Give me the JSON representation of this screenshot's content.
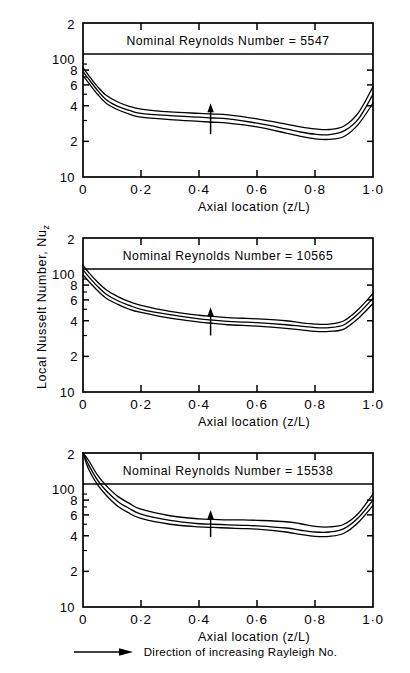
{
  "figure": {
    "axis_y_label_main": "Local Nusselt Number, Nu",
    "axis_y_label_sub": "z",
    "axis_x_label": "Axial location (z/L)",
    "legend_text": "Direction of increasing Rayleigh No.",
    "legend_icon": "right-arrow-icon",
    "annotation_icon": "up-arrow-icon",
    "line_color": "#000000",
    "background_color": "#ffffff"
  },
  "chart_data": [
    {
      "type": "line",
      "title": "Nominal Reynolds Number = 5547",
      "xlabel": "Axial location (z/L)",
      "ylabel": "Local Nusselt Number, Nuz",
      "yscale": "log",
      "ylim": [
        10,
        200
      ],
      "xlim": [
        0,
        1
      ],
      "grid": false,
      "xticks": [
        0,
        0.2,
        0.4,
        0.6,
        0.8,
        1.0
      ],
      "xticklabels": [
        "0",
        "0·2",
        "0·4",
        "0·6",
        "0·8",
        "1·0"
      ],
      "yticks": [
        10,
        20,
        40,
        60,
        80,
        100,
        200
      ],
      "yticklabels": [
        "10",
        "2",
        "4",
        "6",
        "8",
        "100",
        "2"
      ],
      "annotation": {
        "icon": "up-arrow-icon",
        "x": 0.44,
        "y_from": 23,
        "y_to": 42
      },
      "x": [
        0.0,
        0.02,
        0.05,
        0.08,
        0.12,
        0.16,
        0.2,
        0.3,
        0.4,
        0.45,
        0.5,
        0.6,
        0.7,
        0.75,
        0.8,
        0.85,
        0.9,
        0.95,
        1.0
      ],
      "series": [
        {
          "name": "Lowest Rayleigh No.",
          "values": [
            72,
            62,
            50,
            42,
            37,
            34,
            32,
            30.5,
            29.5,
            29,
            28.5,
            26.5,
            23.5,
            22,
            21,
            20.8,
            22,
            28,
            42
          ]
        },
        {
          "name": "Intermediate Rayleigh No.",
          "values": [
            78,
            67,
            54,
            45,
            39.5,
            36.5,
            34.5,
            33,
            32,
            31.5,
            31,
            28.5,
            25.5,
            24,
            23,
            22.8,
            24.5,
            31,
            50
          ]
        },
        {
          "name": "Highest Rayleigh No.",
          "values": [
            84,
            72,
            58,
            49,
            43,
            39.5,
            37.5,
            35.5,
            34.5,
            34,
            33.5,
            31,
            28,
            26.5,
            25.5,
            25.2,
            27,
            35,
            58
          ]
        }
      ]
    },
    {
      "type": "line",
      "title": "Nominal Reynolds Number = 10565",
      "xlabel": "Axial location (z/L)",
      "ylabel": "Local Nusselt Number, Nuz",
      "yscale": "log",
      "ylim": [
        10,
        200
      ],
      "xlim": [
        0,
        1
      ],
      "grid": false,
      "xticks": [
        0,
        0.2,
        0.4,
        0.6,
        0.8,
        1.0
      ],
      "xticklabels": [
        "0",
        "0·2",
        "0·4",
        "0·6",
        "0·8",
        "1·0"
      ],
      "yticks": [
        10,
        20,
        40,
        60,
        80,
        100,
        200
      ],
      "yticklabels": [
        "10",
        "2",
        "4",
        "6",
        "8",
        "100",
        "2"
      ],
      "annotation": {
        "icon": "up-arrow-icon",
        "x": 0.44,
        "y_from": 30,
        "y_to": 52
      },
      "x": [
        0.0,
        0.02,
        0.05,
        0.08,
        0.12,
        0.16,
        0.2,
        0.3,
        0.4,
        0.45,
        0.5,
        0.55,
        0.6,
        0.7,
        0.75,
        0.8,
        0.85,
        0.9,
        0.95,
        1.0
      ],
      "series": [
        {
          "name": "Lowest Rayleigh No.",
          "values": [
            98,
            86,
            72,
            62,
            55,
            50,
            47,
            42,
            39,
            38,
            37,
            36.5,
            36,
            34.5,
            33.5,
            32.5,
            32.5,
            34,
            42,
            56
          ]
        },
        {
          "name": "Intermediate Rayleigh No.",
          "values": [
            108,
            94,
            78,
            67,
            59,
            54,
            50,
            45,
            41.5,
            40.5,
            39.5,
            39,
            38.5,
            37,
            36,
            35,
            35,
            37,
            46,
            62
          ]
        },
        {
          "name": "Highest Rayleigh No.",
          "values": [
            118,
            102,
            85,
            73,
            64,
            58,
            54,
            48,
            44.5,
            43.5,
            42.5,
            42,
            41.5,
            40,
            38.5,
            37.5,
            37.5,
            40,
            50,
            68
          ]
        }
      ]
    },
    {
      "type": "line",
      "title": "Nominal Reynolds Number = 15538",
      "xlabel": "Axial location (z/L)",
      "ylabel": "Local Nusselt Number, Nuz",
      "yscale": "log",
      "ylim": [
        10,
        200
      ],
      "xlim": [
        0,
        1
      ],
      "grid": false,
      "xticks": [
        0,
        0.2,
        0.4,
        0.6,
        0.8,
        1.0
      ],
      "xticklabels": [
        "0",
        "0·2",
        "0·4",
        "0·6",
        "0·8",
        "1·0"
      ],
      "yticks": [
        10,
        20,
        40,
        60,
        80,
        100,
        200
      ],
      "yticklabels": [
        "10",
        "2",
        "4",
        "6",
        "8",
        "100",
        "2"
      ],
      "annotation": {
        "icon": "up-arrow-icon",
        "x": 0.44,
        "y_from": 39,
        "y_to": 66
      },
      "x": [
        0.0,
        0.02,
        0.05,
        0.08,
        0.12,
        0.16,
        0.2,
        0.3,
        0.4,
        0.45,
        0.5,
        0.55,
        0.6,
        0.7,
        0.75,
        0.8,
        0.85,
        0.9,
        0.95,
        1.0
      ],
      "series": [
        {
          "name": "Lowest Rayleigh No.",
          "values": [
            200,
            145,
            108,
            88,
            71,
            62,
            56,
            50,
            47.5,
            47,
            46.5,
            46,
            45.5,
            43,
            41,
            39.5,
            39.5,
            42,
            52,
            72
          ]
        },
        {
          "name": "Intermediate Rayleigh No.",
          "values": [
            200,
            158,
            118,
            96,
            78,
            68,
            61,
            54,
            50.5,
            50,
            49.5,
            49,
            48.5,
            46.5,
            44.5,
            43,
            43,
            46,
            57,
            80
          ]
        },
        {
          "name": "Highest Rayleigh No.",
          "values": [
            200,
            172,
            130,
            106,
            86,
            75,
            67,
            59,
            55.5,
            55,
            54.5,
            54.5,
            54,
            52.5,
            50.5,
            48,
            47.5,
            50,
            62,
            90
          ]
        }
      ]
    }
  ]
}
